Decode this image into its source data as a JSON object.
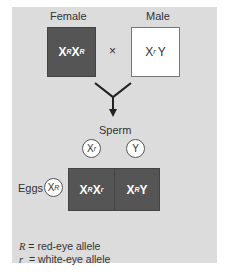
{
  "parents": {
    "female": {
      "label": "Female",
      "genotype_base": [
        "X",
        "X"
      ],
      "genotype_sup": [
        "R",
        "R"
      ],
      "fill": "#555555"
    },
    "cross_symbol": "×",
    "male": {
      "label": "Male",
      "genotype_base": [
        "X",
        "Y"
      ],
      "genotype_sup": [
        "r",
        ""
      ],
      "fill": "#ffffff"
    }
  },
  "gametes": {
    "sperm_label": "Sperm",
    "sperm": [
      {
        "base": "X",
        "sup": "r"
      },
      {
        "base": "Y",
        "sup": ""
      }
    ],
    "eggs_label": "Eggs",
    "eggs": [
      {
        "base": "X",
        "sup": "R"
      }
    ]
  },
  "offspring": [
    {
      "parts": [
        {
          "base": "X",
          "sup": "R"
        },
        {
          "base": "X",
          "sup": "r"
        }
      ]
    },
    {
      "parts": [
        {
          "base": "X",
          "sup": "R"
        },
        {
          "base": "Y",
          "sup": ""
        }
      ]
    }
  ],
  "legend": [
    {
      "symbol": "R",
      "text": "= red-eye allele"
    },
    {
      "symbol": "r",
      "text": "= white-eye allele"
    }
  ],
  "colors": {
    "panel": "#dcdcdc",
    "dark_cell": "#555555",
    "light_cell": "#ffffff"
  }
}
